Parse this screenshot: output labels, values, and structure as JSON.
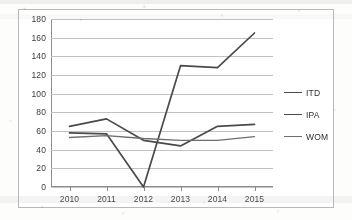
{
  "chart_data": {
    "type": "line",
    "title": "",
    "subtitle": "",
    "xlabel": "",
    "ylabel": "",
    "categories": [
      "2010",
      "2011",
      "2012",
      "2013",
      "2014",
      "2015"
    ],
    "x": [
      2010,
      2011,
      2012,
      2013,
      2014,
      2015
    ],
    "ylim": [
      0,
      180
    ],
    "yticks": [
      0,
      20,
      40,
      60,
      80,
      100,
      120,
      140,
      160,
      180
    ],
    "ytick_labels": [
      "0",
      "20",
      "40",
      "60",
      "80",
      "100",
      "120",
      "140",
      "160",
      "180"
    ],
    "grid": true,
    "grid_axis": "y",
    "legend_position": "right",
    "series": [
      {
        "name": "ITD",
        "values": [
          58,
          57,
          0,
          130,
          128,
          165
        ],
        "color": "#4a4a4d"
      },
      {
        "name": "IPA",
        "values": [
          65,
          73,
          50,
          44,
          65,
          67
        ],
        "color": "#4a4a4d"
      },
      {
        "name": "WOM",
        "values": [
          53,
          55,
          52,
          50,
          50,
          54
        ],
        "color": "#6d6d72"
      }
    ]
  },
  "legend": {
    "items": [
      {
        "label": "ITD"
      },
      {
        "label": "IPA"
      },
      {
        "label": "WOM"
      }
    ]
  },
  "axes": {
    "y": {
      "labels": [
        "180",
        "160",
        "140",
        "120",
        "100",
        "80",
        "60",
        "40",
        "20",
        "0"
      ]
    },
    "x": {
      "labels": [
        "2010",
        "2011",
        "2012",
        "2013",
        "2014",
        "2015"
      ]
    }
  }
}
